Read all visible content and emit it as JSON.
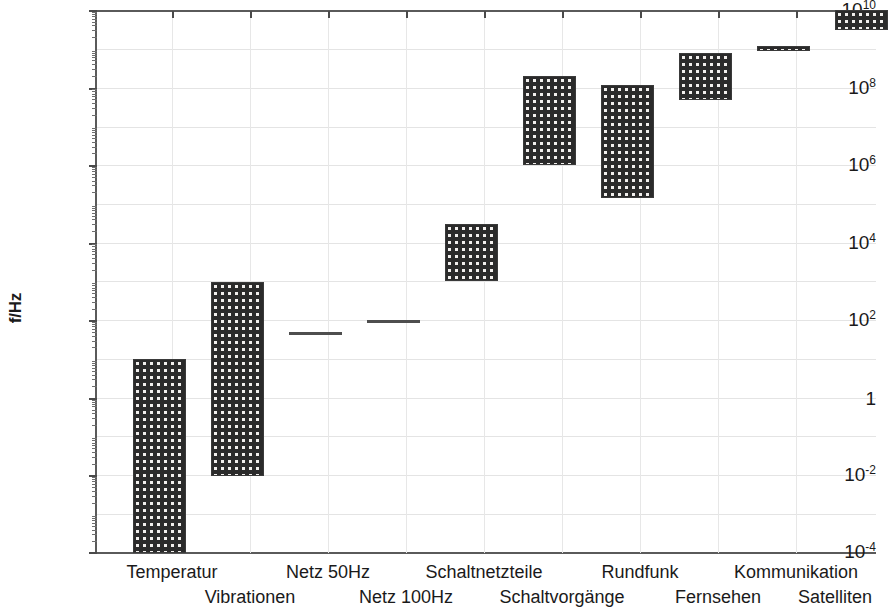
{
  "chart_data": {
    "type": "bar",
    "title": "",
    "subtitle": "",
    "xlabel": "",
    "ylabel": "f/Hz",
    "yscale": "log",
    "ylim": [
      0.0001,
      10000000000
    ],
    "grid": true,
    "legend": null,
    "orientation": "vertical",
    "note": "Floating range bars (min-max frequency band) per source category. Values in Hz.",
    "ytick_labels": [
      "10^10",
      "10^8",
      "10^6",
      "10^4",
      "10^2",
      "1",
      "10^-2",
      "10^-4"
    ],
    "ytick_values": [
      10000000000,
      100000000,
      1000000,
      10000,
      100,
      1,
      0.01,
      0.0001
    ],
    "categories": [
      "Temperatur",
      "Vibrationen",
      "Netz 50Hz",
      "Netz 100Hz",
      "Schaltnetzteile",
      "Schaltvorgänge",
      "Rundfunk",
      "Fernsehen",
      "Kommunikation",
      "Satelliten"
    ],
    "ranges": [
      {
        "category": "Temperatur",
        "low": 0.0001,
        "high": 10.0,
        "low_label": "10^-4",
        "high_label": "10^1"
      },
      {
        "category": "Vibrationen",
        "low": 0.01,
        "high": 1000.0,
        "low_label": "10^-2",
        "high_label": "10^3"
      },
      {
        "category": "Netz 50Hz",
        "low": 50.0,
        "high": 50.0,
        "low_label": "50",
        "high_label": "50"
      },
      {
        "category": "Netz 100Hz",
        "low": 100.0,
        "high": 100.0,
        "low_label": "100",
        "high_label": "100"
      },
      {
        "category": "Schaltnetzteile",
        "low": 1000.0,
        "high": 30000.0,
        "low_label": "10^3",
        "high_label": "3·10^4"
      },
      {
        "category": "Schaltvorgänge",
        "low": 1000000.0,
        "high": 200000000.0,
        "low_label": "10^6",
        "high_label": "2·10^8"
      },
      {
        "category": "Rundfunk",
        "low": 150000.0,
        "high": 120000000.0,
        "low_label": "1.5·10^5",
        "high_label": "1.2·10^8"
      },
      {
        "category": "Fernsehen",
        "low": 50000000.0,
        "high": 800000000.0,
        "low_label": "5·10^7",
        "high_label": "8·10^8"
      },
      {
        "category": "Kommunikation",
        "low": 900000000.0,
        "high": 1200000000.0,
        "low_label": "9·10^8",
        "high_label": "1.2·10^9"
      },
      {
        "category": "Satelliten",
        "low": 3000000000.0,
        "high": 10000000000.0,
        "low_label": "3·10^9",
        "high_label": "10^10"
      }
    ]
  },
  "axis": {
    "y_title": "f/Hz",
    "ticks": [
      {
        "label_mantissa": "10",
        "label_exp": "10"
      },
      {
        "label_mantissa": "10",
        "label_exp": "8"
      },
      {
        "label_mantissa": "10",
        "label_exp": "6"
      },
      {
        "label_mantissa": "10",
        "label_exp": "4"
      },
      {
        "label_mantissa": "10",
        "label_exp": "2"
      },
      {
        "label_mantissa": "1",
        "label_exp": ""
      },
      {
        "label_mantissa": "10",
        "label_exp": "-2"
      },
      {
        "label_mantissa": "10",
        "label_exp": "-4"
      }
    ]
  },
  "x_labels": {
    "row_top": [
      "Temperatur",
      "Netz 50Hz",
      "Schaltnetzteile",
      "Rundfunk",
      "Kommunikation"
    ],
    "row_bottom": [
      "Vibrationen",
      "Netz 100Hz",
      "Schaltvorgänge",
      "Fernsehen",
      "Satelliten"
    ]
  },
  "style": {
    "bar_fill": "#2b2b2b",
    "bar_dot": "#f2f0ee",
    "axis_color": "#5a5a5a",
    "grid_color": "#e4e4e4",
    "text_color": "#1a1a1a",
    "background": "#ffffff"
  }
}
